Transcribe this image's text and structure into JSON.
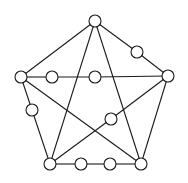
{
  "diagram": {
    "type": "graph",
    "style": {
      "stroke": "#1a1a1a",
      "node_fill": "#ffffff",
      "node_radius": 6
    },
    "nodes": [
      {
        "id": "top",
        "x": 95,
        "y": 21
      },
      {
        "id": "left",
        "x": 21,
        "y": 77
      },
      {
        "id": "right",
        "x": 168,
        "y": 76
      },
      {
        "id": "bottom_left",
        "x": 50,
        "y": 164
      },
      {
        "id": "bottom_right",
        "x": 141,
        "y": 164
      },
      {
        "id": "upper_right_mid",
        "x": 137,
        "y": 52
      },
      {
        "id": "mid_a",
        "x": 52,
        "y": 77
      },
      {
        "id": "mid_b",
        "x": 95,
        "y": 77
      },
      {
        "id": "left_mid",
        "x": 32,
        "y": 110
      },
      {
        "id": "center_right",
        "x": 111,
        "y": 119
      },
      {
        "id": "bottom_a",
        "x": 81,
        "y": 164
      },
      {
        "id": "bottom_b",
        "x": 110,
        "y": 164
      }
    ],
    "edges": [
      [
        "top",
        "left"
      ],
      [
        "top",
        "upper_right_mid"
      ],
      [
        "upper_right_mid",
        "right"
      ],
      [
        "top",
        "bottom_left"
      ],
      [
        "top",
        "bottom_right"
      ],
      [
        "left",
        "mid_a"
      ],
      [
        "mid_a",
        "mid_b"
      ],
      [
        "mid_b",
        "right"
      ],
      [
        "left",
        "left_mid"
      ],
      [
        "left_mid",
        "bottom_left"
      ],
      [
        "left",
        "bottom_right"
      ],
      [
        "right",
        "bottom_right"
      ],
      [
        "right",
        "center_right"
      ],
      [
        "center_right",
        "bottom_left"
      ],
      [
        "bottom_left",
        "bottom_a"
      ],
      [
        "bottom_a",
        "bottom_b"
      ],
      [
        "bottom_b",
        "bottom_right"
      ]
    ]
  }
}
